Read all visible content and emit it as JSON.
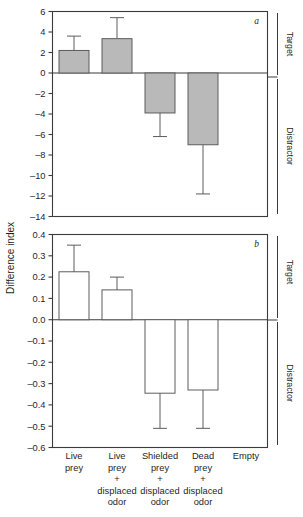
{
  "figure": {
    "y_axis_title": "Difference index",
    "side_labels": {
      "above_zero": "Target",
      "below_zero": "Distractor"
    },
    "panel_letters": {
      "a": "a",
      "b": "b"
    },
    "categories": [
      {
        "line1": "Live",
        "line2": "prey",
        "line3": "",
        "line4": ""
      },
      {
        "line1": "Live",
        "line2": "prey",
        "line3": "+",
        "line4": "displaced",
        "line5": "odor"
      },
      {
        "line1": "Shielded",
        "line2": "prey",
        "line3": "+",
        "line4": "displaced",
        "line5": "odor"
      },
      {
        "line1": "Dead",
        "line2": "prey",
        "line3": "+",
        "line4": "displaced",
        "line5": "odor"
      },
      {
        "line1": "Empty",
        "line2": "",
        "line3": "",
        "line4": ""
      }
    ]
  },
  "chart_data": [
    {
      "type": "bar",
      "panel": "a",
      "title": "",
      "xlabel": "",
      "ylabel": "Difference index",
      "ylim": [
        -14,
        6
      ],
      "yticks": [
        6,
        4,
        2,
        0,
        -2,
        -4,
        -6,
        -8,
        -10,
        -12,
        -14
      ],
      "ytick_labels": [
        "6",
        "4",
        "2",
        "0",
        "–2",
        "–4",
        "–6",
        "–8",
        "–10",
        "–12",
        "–14"
      ],
      "grid": false,
      "legend": "none",
      "bar_style": "filled-gray",
      "categories": [
        "Live prey",
        "Live prey + displaced odor",
        "Shielded prey + displaced odor",
        "Dead prey + displaced odor",
        "Empty"
      ],
      "values": [
        2.2,
        3.35,
        -3.9,
        -7.0,
        null
      ],
      "error_high": [
        3.6,
        5.4,
        null,
        null,
        null
      ],
      "error_low": [
        null,
        null,
        -6.2,
        -11.8,
        null
      ],
      "zero_line": 0
    },
    {
      "type": "bar",
      "panel": "b",
      "title": "",
      "xlabel": "",
      "ylabel": "Difference index",
      "ylim": [
        -0.6,
        0.4
      ],
      "yticks": [
        0.4,
        0.3,
        0.2,
        0.1,
        0.0,
        -0.1,
        -0.2,
        -0.3,
        -0.4,
        -0.5,
        -0.6
      ],
      "ytick_labels": [
        "0.4",
        "0.3",
        "0.2",
        "0.1",
        "0.0",
        "–0.1",
        "–0.2",
        "–0.3",
        "–0.4",
        "–0.5",
        "–0.6"
      ],
      "grid": false,
      "legend": "none",
      "bar_style": "open-white",
      "categories": [
        "Live prey",
        "Live prey + displaced odor",
        "Shielded prey + displaced odor",
        "Dead prey + displaced odor",
        "Empty"
      ],
      "values": [
        0.225,
        0.14,
        -0.345,
        -0.33,
        null
      ],
      "error_high": [
        0.35,
        0.2,
        null,
        null,
        null
      ],
      "error_low": [
        null,
        null,
        -0.51,
        -0.51,
        null
      ],
      "zero_line": 0
    }
  ],
  "colors": {
    "bar_fill_gray": "#b9b9b9",
    "bar_stroke": "#5c5c5c",
    "axis": "#3b3b3b",
    "text": "#1f1f1f",
    "background": "#ffffff"
  }
}
